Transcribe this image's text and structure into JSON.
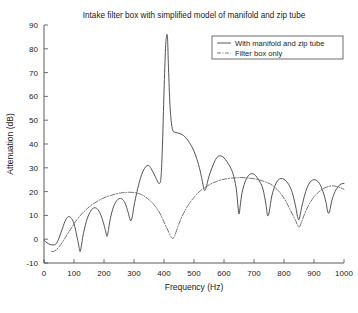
{
  "chart_data": {
    "type": "line",
    "title": "Intake filter box with simplified model of manifold and zip tube",
    "xlabel": "Frequency (Hz)",
    "ylabel": "Attenuation (dB)",
    "xlim": [
      0,
      1000
    ],
    "ylim": [
      -10,
      90
    ],
    "xticks": [
      0,
      100,
      200,
      300,
      400,
      500,
      600,
      700,
      800,
      900,
      1000
    ],
    "yticks": [
      -10,
      0,
      10,
      20,
      30,
      40,
      50,
      60,
      70,
      80,
      90
    ],
    "grid": false,
    "legend_position": "top-right",
    "series": [
      {
        "name": "With manifold and zip tube",
        "style": "solid",
        "color": "#3f3f3f",
        "x": [
          0,
          10,
          20,
          30,
          40,
          50,
          60,
          70,
          80,
          90,
          100,
          110,
          115,
          120,
          125,
          130,
          140,
          150,
          160,
          170,
          180,
          190,
          200,
          205,
          210,
          215,
          220,
          230,
          240,
          250,
          260,
          270,
          280,
          285,
          290,
          295,
          300,
          310,
          320,
          330,
          340,
          350,
          360,
          370,
          380,
          385,
          390,
          395,
          400,
          405,
          408,
          410,
          412,
          415,
          420,
          425,
          430,
          435,
          440,
          450,
          460,
          470,
          480,
          490,
          500,
          510,
          520,
          530,
          535,
          540,
          545,
          550,
          560,
          570,
          580,
          590,
          600,
          610,
          620,
          630,
          640,
          645,
          650,
          655,
          660,
          670,
          680,
          690,
          700,
          710,
          720,
          730,
          740,
          745,
          750,
          755,
          760,
          770,
          780,
          790,
          800,
          810,
          820,
          830,
          840,
          845,
          850,
          855,
          860,
          870,
          880,
          890,
          900,
          910,
          920,
          930,
          940,
          945,
          950,
          955,
          960,
          970,
          980,
          990,
          1000
        ],
        "y": [
          -0.5,
          -1.5,
          -2.2,
          -2.4,
          -2.0,
          0.5,
          4.0,
          7.5,
          9.4,
          9.0,
          6.5,
          1.0,
          -2.0,
          -5.2,
          -2.5,
          1.5,
          7.0,
          10.5,
          12.6,
          13.2,
          12.4,
          10.0,
          6.0,
          3.5,
          1.2,
          4.0,
          8.0,
          13.0,
          15.8,
          17.0,
          16.9,
          15.2,
          11.5,
          9.0,
          7.8,
          10.0,
          14.0,
          20.0,
          25.0,
          28.5,
          30.6,
          30.9,
          29.0,
          26.5,
          24.0,
          23.4,
          26.0,
          40.0,
          62.0,
          80.0,
          85.0,
          86.0,
          84.0,
          72.0,
          56.0,
          48.5,
          45.5,
          45.0,
          44.8,
          44.5,
          44.0,
          43.0,
          41.5,
          39.5,
          37.0,
          33.5,
          29.0,
          23.0,
          20.5,
          21.5,
          24.0,
          26.5,
          30.0,
          33.0,
          34.8,
          35.0,
          34.2,
          32.5,
          30.5,
          27.5,
          22.0,
          16.0,
          10.6,
          15.0,
          19.5,
          24.0,
          26.5,
          27.5,
          27.3,
          26.0,
          24.0,
          21.0,
          14.5,
          10.0,
          11.0,
          15.0,
          18.5,
          22.5,
          24.8,
          25.5,
          25.2,
          24.0,
          22.0,
          18.5,
          13.0,
          9.5,
          8.2,
          11.0,
          14.0,
          19.0,
          22.5,
          24.4,
          25.0,
          24.6,
          23.0,
          20.0,
          15.5,
          11.8,
          11.0,
          13.5,
          16.5,
          20.0,
          22.0,
          23.2,
          23.4
        ]
      },
      {
        "name": "Filter box only",
        "style": "dashdot",
        "color": "#5a5a5a",
        "x": [
          25,
          30,
          40,
          50,
          60,
          70,
          80,
          90,
          100,
          110,
          120,
          130,
          140,
          150,
          160,
          170,
          180,
          190,
          200,
          210,
          220,
          230,
          240,
          250,
          260,
          270,
          280,
          290,
          300,
          310,
          320,
          330,
          340,
          350,
          360,
          370,
          380,
          390,
          400,
          410,
          420,
          425,
          430,
          435,
          440,
          450,
          460,
          470,
          480,
          490,
          500,
          510,
          520,
          530,
          540,
          550,
          560,
          570,
          580,
          590,
          600,
          620,
          640,
          660,
          680,
          700,
          720,
          740,
          760,
          780,
          790,
          800,
          810,
          820,
          830,
          840,
          845,
          850,
          855,
          860,
          870,
          880,
          890,
          900,
          910,
          920,
          930,
          940,
          950,
          960,
          970,
          980,
          990,
          1000
        ],
        "y": [
          -5.0,
          -5.2,
          -4.5,
          -3.2,
          -1.5,
          0.5,
          2.5,
          4.5,
          6.5,
          8.2,
          9.8,
          11.2,
          12.4,
          13.5,
          14.5,
          15.3,
          16.1,
          16.8,
          17.4,
          17.9,
          18.3,
          18.7,
          19.0,
          19.3,
          19.5,
          19.6,
          19.7,
          19.7,
          19.6,
          19.4,
          19.0,
          18.4,
          17.6,
          16.6,
          15.4,
          14.0,
          12.2,
          10.0,
          7.2,
          4.5,
          1.8,
          0.8,
          0.3,
          1.2,
          3.0,
          6.5,
          9.5,
          12.0,
          14.2,
          16.0,
          17.6,
          19.0,
          20.2,
          21.2,
          22.0,
          22.8,
          23.5,
          24.0,
          24.5,
          24.9,
          25.2,
          25.6,
          25.8,
          25.9,
          25.7,
          25.4,
          24.8,
          24.0,
          22.8,
          20.5,
          19.0,
          17.2,
          15.0,
          12.5,
          10.0,
          7.5,
          6.0,
          5.0,
          6.0,
          7.8,
          11.0,
          13.8,
          16.0,
          17.8,
          19.2,
          20.3,
          21.2,
          21.8,
          22.2,
          22.4,
          22.3,
          22.0,
          21.5,
          21.0
        ]
      }
    ]
  }
}
